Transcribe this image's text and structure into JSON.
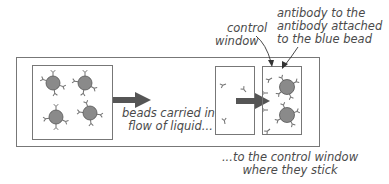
{
  "diagram": {
    "labels": {
      "beads_flow": [
        "beads carried in",
        "flow of liquid..."
      ],
      "control_window": [
        "control",
        "window"
      ],
      "antibody_desc": [
        "antibody to the",
        "antibody attached",
        "to the blue bead"
      ],
      "result": [
        "...to the control window",
        "where they stick"
      ]
    },
    "colors": {
      "bead_fill": "#8a8a8a",
      "bead_stroke": "#555555",
      "box_stroke": "#777777",
      "arrow": "#555555",
      "antibody": "#707070",
      "text": "#4a4a4a"
    },
    "elements": {
      "sample_box": {
        "beads": 4
      },
      "control_window_empty": {
        "free_antibodies": 3
      },
      "control_window_bound": {
        "beads": 2
      }
    }
  }
}
